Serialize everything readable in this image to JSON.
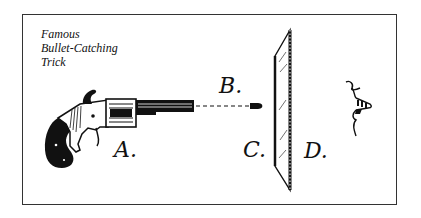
{
  "illustration": {
    "title_lines": [
      "Famous",
      "Bullet-Catching",
      "Trick"
    ],
    "labels": {
      "a": "A.",
      "b": "B.",
      "c": "C.",
      "d": "D."
    },
    "colors": {
      "ink": "#111111",
      "paper": "#ffffff",
      "frame": "#333333"
    }
  }
}
